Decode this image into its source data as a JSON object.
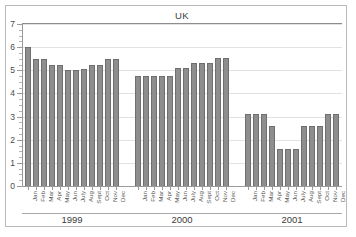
{
  "chart_data": {
    "type": "bar",
    "title": "UK",
    "xlabel": "",
    "ylabel": "",
    "ylim": [
      0,
      7
    ],
    "y_ticks": [
      0,
      1,
      2,
      3,
      4,
      5,
      6,
      7
    ],
    "y_tick_labels": [
      "0",
      "1",
      "2",
      "3",
      "4",
      "5",
      "6",
      "7"
    ],
    "minor_tick_step": 0.25,
    "grid": true,
    "legend": "none",
    "groups": [
      {
        "name": "1999",
        "categories": [
          "Jan",
          "Feb",
          "Mar",
          "Apr",
          "May",
          "Jun",
          "July",
          "Aug",
          "Sept",
          "Oct",
          "Nov",
          "Dec"
        ],
        "values": [
          6.0,
          5.5,
          5.5,
          5.25,
          5.25,
          5.0,
          5.0,
          5.05,
          5.25,
          5.25,
          5.5,
          5.5
        ]
      },
      {
        "name": "2000",
        "categories": [
          "Jan",
          "Feb",
          "Mar",
          "Apr",
          "May",
          "Jun",
          "July",
          "Aug",
          "Sept",
          "Oct",
          "Nov",
          "Dec"
        ],
        "values": [
          4.75,
          4.75,
          4.75,
          4.75,
          4.75,
          5.1,
          5.1,
          5.3,
          5.3,
          5.3,
          5.55,
          5.55
        ]
      },
      {
        "name": "2001",
        "categories": [
          "Jan",
          "Feb",
          "Mar",
          "Apr",
          "May",
          "Jun",
          "July",
          "Aug",
          "Sept",
          "Oct",
          "Nov",
          "Dec"
        ],
        "values": [
          3.1,
          3.1,
          3.1,
          2.6,
          1.6,
          1.6,
          1.6,
          2.6,
          2.6,
          2.6,
          3.1,
          3.1
        ]
      }
    ],
    "bar_color": "#8e8e8e",
    "bar_edge_color": "#6f6f6f",
    "grid_color": "#e2e2e2",
    "axis_color": "#9a9a9a",
    "frame_color": "#b9b9b9",
    "background": "#ffffff"
  }
}
